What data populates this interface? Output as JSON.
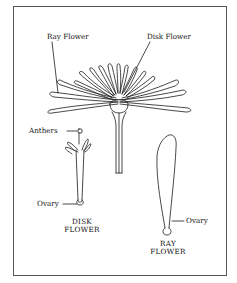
{
  "diagram": {
    "labels": {
      "ray_flower_top": "Ray Flower",
      "disk_flower_top": "Disk Flower",
      "anthers": "Anthers",
      "ovary_disk": "Ovary",
      "ovary_ray": "Ovary"
    },
    "captions": {
      "disk_flower_line1": "DISK",
      "disk_flower_line2": "FLOWER",
      "ray_flower_line1": "RAY",
      "ray_flower_line2": "FLOWER"
    },
    "colors": {
      "line": "#1a1a1a",
      "background": "#ffffff",
      "frame": "#555555"
    }
  }
}
